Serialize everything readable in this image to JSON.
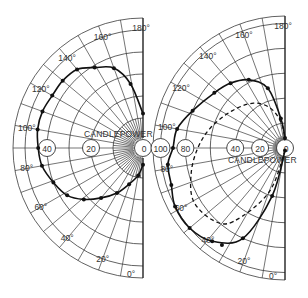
{
  "chart_data": [
    {
      "type": "polar",
      "name": "left",
      "title": "",
      "radial_label": "CANDLEPOWER",
      "angle_ticks": [
        "0°",
        "20°",
        "40°",
        "60°",
        "80°",
        "100°",
        "120°",
        "140°",
        "160°",
        "180°"
      ],
      "radial_tick_labels": [
        "0",
        "20",
        "40"
      ],
      "radial_range": [
        0,
        55
      ],
      "angle_range": [
        0,
        180
      ],
      "grid": true,
      "series": [
        {
          "name": "distribution",
          "style": "solid",
          "points": [
            [
              0,
              4
            ],
            [
              10,
              9
            ],
            [
              21,
              14
            ],
            [
              30,
              20
            ],
            [
              40,
              26
            ],
            [
              49,
              32
            ],
            [
              58,
              37
            ],
            [
              69,
              40
            ],
            [
              80,
              43
            ],
            [
              90,
              44
            ],
            [
              100,
              45
            ],
            [
              110,
              45
            ],
            [
              120,
              44
            ],
            [
              130,
              44
            ],
            [
              140,
              43
            ],
            [
              149,
              39
            ],
            [
              160,
              35
            ],
            [
              169,
              26
            ],
            [
              180,
              12
            ]
          ]
        }
      ]
    },
    {
      "type": "polar",
      "name": "right",
      "title": "",
      "radial_label": "CANDLEPOWER",
      "angle_ticks": [
        "0°",
        "20°",
        "40°",
        "60°",
        "80°",
        "100°",
        "120°",
        "140°",
        "160°",
        "180°"
      ],
      "radial_tick_labels": [
        "0",
        "20",
        "40",
        "80",
        "100"
      ],
      "radial_range": [
        0,
        105
      ],
      "angle_range": [
        0,
        180
      ],
      "grid": true,
      "series": [
        {
          "name": "solid",
          "style": "solid",
          "points": [
            [
              0,
              2
            ],
            [
              15,
              40
            ],
            [
              25,
              80
            ],
            [
              38,
              95
            ],
            [
              50,
              100
            ],
            [
              62,
              100
            ],
            [
              72,
              96
            ],
            [
              82,
              95
            ],
            [
              90,
              90
            ],
            [
              100,
              88
            ],
            [
              112,
              80
            ],
            [
              128,
              72
            ],
            [
              140,
              68
            ],
            [
              152,
              62
            ],
            [
              164,
              50
            ],
            [
              172,
              24
            ],
            [
              180,
              8
            ]
          ]
        },
        {
          "name": "dashed",
          "style": "dashed",
          "points": [
            [
              0,
              2
            ],
            [
              20,
              38
            ],
            [
              35,
              72
            ],
            [
              45,
              82
            ],
            [
              60,
              85
            ],
            [
              75,
              78
            ],
            [
              90,
              70
            ],
            [
              105,
              62
            ],
            [
              125,
              52
            ],
            [
              145,
              44
            ],
            [
              160,
              34
            ],
            [
              172,
              20
            ],
            [
              180,
              6
            ]
          ]
        }
      ],
      "extra_points": [
        [
          33,
          93
        ]
      ]
    }
  ]
}
